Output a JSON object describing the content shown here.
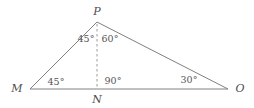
{
  "figure": {
    "kind": "geometry-triangle-diagram",
    "background_color": "#ffffff",
    "stroke_color": "#808080",
    "dashed_stroke_color": "#9a9a9a",
    "text_color": "#4d4d4d",
    "width": 254,
    "height": 108
  },
  "vertices": [
    {
      "id": "M",
      "label": "M",
      "x": 30,
      "y": 89,
      "label_x": 17,
      "label_y": 88
    },
    {
      "id": "N",
      "label": "N",
      "x": 97,
      "y": 89,
      "label_x": 97,
      "label_y": 99
    },
    {
      "id": "O",
      "label": "O",
      "x": 228,
      "y": 89,
      "label_x": 240,
      "label_y": 88
    },
    {
      "id": "P",
      "label": "P",
      "x": 97,
      "y": 22,
      "label_x": 97,
      "label_y": 11
    }
  ],
  "segments": [
    {
      "id": "MP",
      "from": "M",
      "to": "P",
      "style": "solid"
    },
    {
      "id": "PO",
      "from": "P",
      "to": "O",
      "style": "solid"
    },
    {
      "id": "MO",
      "from": "M",
      "to": "O",
      "style": "solid"
    },
    {
      "id": "PN",
      "from": "P",
      "to": "N",
      "style": "dashed"
    }
  ],
  "angles": [
    {
      "id": "angle-MPN",
      "at": "P",
      "value": "45°",
      "x": 86,
      "y": 39
    },
    {
      "id": "angle-NPO",
      "at": "P",
      "value": "60°",
      "x": 110,
      "y": 39
    },
    {
      "id": "angle-PMN",
      "at": "M",
      "value": "45°",
      "x": 56,
      "y": 82
    },
    {
      "id": "angle-PNO",
      "at": "N",
      "value": "90°",
      "x": 113,
      "y": 81
    },
    {
      "id": "angle-POM",
      "at": "O",
      "value": "30°",
      "x": 189,
      "y": 80
    }
  ]
}
